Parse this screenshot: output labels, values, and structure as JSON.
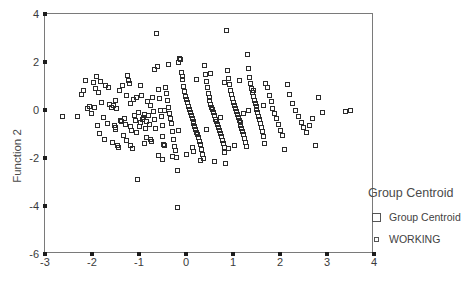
{
  "chart_data": {
    "type": "scatter",
    "title": "",
    "xlabel": "",
    "ylabel": "Function 2",
    "xlim": [
      -3,
      4
    ],
    "ylim": [
      -6,
      4
    ],
    "xticks": [
      -3,
      -2,
      -1,
      0,
      1,
      2,
      3,
      4
    ],
    "yticks": [
      -6,
      -4,
      -2,
      0,
      2,
      4
    ],
    "grid": false,
    "legend_position": "right",
    "legend_title": "Group Centroid",
    "legend": [
      {
        "label": "Group Centroid",
        "marker": "square-open-large"
      },
      {
        "label": "WORKING",
        "marker": "square-open-small"
      }
    ],
    "series": [
      {
        "name": "WORKING",
        "marker": "square-open",
        "color": "#2b2b2b",
        "points": [
          [
            -2.62,
            -0.28
          ],
          [
            -2.3,
            -0.3
          ],
          [
            -2.22,
            0.64
          ],
          [
            -2.12,
            1.22
          ],
          [
            -2.08,
            0.04
          ],
          [
            -2.04,
            0.12
          ],
          [
            -2.0,
            -0.18
          ],
          [
            -1.96,
            1.12
          ],
          [
            -1.92,
            0.86
          ],
          [
            -1.9,
            1.36
          ],
          [
            -1.86,
            0.7
          ],
          [
            -1.84,
            -1.02
          ],
          [
            -1.8,
            1.16
          ],
          [
            -1.78,
            0.3
          ],
          [
            -1.74,
            -0.32
          ],
          [
            -1.7,
            1.02
          ],
          [
            -1.66,
            -0.58
          ],
          [
            -1.62,
            0.22
          ],
          [
            -1.58,
            0.1
          ],
          [
            -1.56,
            -1.38
          ],
          [
            -1.54,
            0.16
          ],
          [
            -1.52,
            -0.66
          ],
          [
            -1.5,
            -0.74
          ],
          [
            -1.48,
            -0.84
          ],
          [
            -1.46,
            0.06
          ],
          [
            -1.44,
            -1.48
          ],
          [
            -1.42,
            -1.6
          ],
          [
            -1.4,
            0.78
          ],
          [
            -1.38,
            -0.44
          ],
          [
            -1.36,
            -0.52
          ],
          [
            -1.34,
            0.98
          ],
          [
            -1.3,
            -0.36
          ],
          [
            -1.28,
            -0.62
          ],
          [
            -1.26,
            -1.3
          ],
          [
            -1.24,
            1.42
          ],
          [
            -1.22,
            1.2
          ],
          [
            -1.2,
            1.08
          ],
          [
            -1.18,
            -0.7
          ],
          [
            -1.16,
            0.26
          ],
          [
            -1.14,
            -0.88
          ],
          [
            -1.12,
            -1.62
          ],
          [
            -1.1,
            0.4
          ],
          [
            -1.08,
            -0.24
          ],
          [
            -1.06,
            -0.46
          ],
          [
            -1.04,
            -0.96
          ],
          [
            -1.02,
            -2.92
          ],
          [
            -1.0,
            -0.14
          ],
          [
            -0.98,
            -0.72
          ],
          [
            -0.96,
            -0.56
          ],
          [
            -0.94,
            0.6
          ],
          [
            -0.92,
            -0.4
          ],
          [
            -0.9,
            -0.34
          ],
          [
            -0.88,
            -0.2
          ],
          [
            -0.86,
            -0.78
          ],
          [
            -0.84,
            -1.18
          ],
          [
            -0.82,
            -0.5
          ],
          [
            -0.8,
            0.34
          ],
          [
            -0.78,
            -0.26
          ],
          [
            -0.76,
            -0.64
          ],
          [
            -0.74,
            -1.24
          ],
          [
            -0.72,
            -1.34
          ],
          [
            -0.7,
            0.52
          ],
          [
            -0.68,
            -0.1
          ],
          [
            -0.66,
            -0.42
          ],
          [
            -0.64,
            -0.8
          ],
          [
            -0.62,
            3.16
          ],
          [
            -0.6,
            1.78
          ],
          [
            -0.58,
            0.84
          ],
          [
            -0.56,
            0.44
          ],
          [
            -0.54,
            -0.06
          ],
          [
            -0.52,
            -0.3
          ],
          [
            -0.5,
            -0.68
          ],
          [
            -0.48,
            -1.12
          ],
          [
            -0.46,
            -1.44
          ],
          [
            -0.44,
            -1.52
          ],
          [
            -0.42,
            0.92
          ],
          [
            -0.4,
            0.66
          ],
          [
            -0.38,
            0.38
          ],
          [
            -0.36,
            0.08
          ],
          [
            -0.34,
            -0.16
          ],
          [
            -0.32,
            -0.38
          ],
          [
            -0.3,
            -0.6
          ],
          [
            -0.28,
            -0.9
          ],
          [
            -0.26,
            -1.26
          ],
          [
            -0.24,
            -1.56
          ],
          [
            -0.22,
            -1.7
          ],
          [
            -0.2,
            -2.02
          ],
          [
            -0.18,
            -4.08
          ],
          [
            -0.16,
            -2.56
          ],
          [
            -0.14,
            1.96
          ],
          [
            -0.12,
            2.12
          ],
          [
            -0.1,
            2.08
          ],
          [
            -0.08,
            1.56
          ],
          [
            -0.06,
            1.24
          ],
          [
            -0.04,
            0.96
          ],
          [
            -0.02,
            0.74
          ],
          [
            0.0,
            0.56
          ],
          [
            0.02,
            0.42
          ],
          [
            0.04,
            0.28
          ],
          [
            0.06,
            0.14
          ],
          [
            0.08,
            0.02
          ],
          [
            0.1,
            -0.12
          ],
          [
            0.12,
            -0.24
          ],
          [
            0.14,
            -0.36
          ],
          [
            0.16,
            -0.48
          ],
          [
            0.18,
            -0.58
          ],
          [
            0.2,
            -0.7
          ],
          [
            0.22,
            -0.82
          ],
          [
            0.24,
            -0.94
          ],
          [
            0.26,
            -1.06
          ],
          [
            0.28,
            -1.18
          ],
          [
            0.3,
            -1.32
          ],
          [
            0.32,
            -1.46
          ],
          [
            0.34,
            -1.66
          ],
          [
            0.36,
            -1.86
          ],
          [
            0.38,
            -2.04
          ],
          [
            0.4,
            1.82
          ],
          [
            0.42,
            1.44
          ],
          [
            0.44,
            1.18
          ],
          [
            0.46,
            0.9
          ],
          [
            0.48,
            0.68
          ],
          [
            0.5,
            0.5
          ],
          [
            0.52,
            0.36
          ],
          [
            0.54,
            0.22
          ],
          [
            0.56,
            0.1
          ],
          [
            0.58,
            -0.02
          ],
          [
            0.6,
            -0.14
          ],
          [
            0.62,
            -0.26
          ],
          [
            0.64,
            -0.4
          ],
          [
            0.66,
            -0.52
          ],
          [
            0.68,
            -0.64
          ],
          [
            0.7,
            -0.76
          ],
          [
            0.72,
            -0.88
          ],
          [
            0.74,
            -1.0
          ],
          [
            0.76,
            -1.14
          ],
          [
            0.78,
            -1.28
          ],
          [
            0.8,
            -1.42
          ],
          [
            0.82,
            -1.58
          ],
          [
            0.84,
            -1.78
          ],
          [
            0.86,
            -2.26
          ],
          [
            0.88,
            3.28
          ],
          [
            0.9,
            1.62
          ],
          [
            0.92,
            1.3
          ],
          [
            0.94,
            1.04
          ],
          [
            0.96,
            0.8
          ],
          [
            0.98,
            0.62
          ],
          [
            1.0,
            0.46
          ],
          [
            1.02,
            0.3
          ],
          [
            1.04,
            0.16
          ],
          [
            1.06,
            0.04
          ],
          [
            1.08,
            -0.08
          ],
          [
            1.1,
            -0.2
          ],
          [
            1.12,
            -0.32
          ],
          [
            1.14,
            -0.44
          ],
          [
            1.16,
            -0.56
          ],
          [
            1.18,
            -0.68
          ],
          [
            1.2,
            -0.8
          ],
          [
            1.22,
            -0.92
          ],
          [
            1.24,
            -1.04
          ],
          [
            1.26,
            -1.2
          ],
          [
            1.28,
            -1.36
          ],
          [
            1.3,
            -1.54
          ],
          [
            1.32,
            2.28
          ],
          [
            1.34,
            1.7
          ],
          [
            1.36,
            1.34
          ],
          [
            1.38,
            1.1
          ],
          [
            1.4,
            0.88
          ],
          [
            1.42,
            0.7
          ],
          [
            1.44,
            0.54
          ],
          [
            1.46,
            0.38
          ],
          [
            1.48,
            0.24
          ],
          [
            1.5,
            0.12
          ],
          [
            1.52,
            0.0
          ],
          [
            1.54,
            -0.12
          ],
          [
            1.56,
            -0.28
          ],
          [
            1.58,
            -0.42
          ],
          [
            1.6,
            -0.58
          ],
          [
            1.62,
            -0.74
          ],
          [
            1.64,
            -0.9
          ],
          [
            1.66,
            -1.12
          ],
          [
            1.68,
            -1.4
          ],
          [
            1.7,
            1.08
          ],
          [
            1.74,
            0.92
          ],
          [
            1.78,
            0.58
          ],
          [
            1.82,
            0.32
          ],
          [
            1.86,
            0.06
          ],
          [
            1.9,
            -0.18
          ],
          [
            1.94,
            -0.38
          ],
          [
            1.98,
            -0.62
          ],
          [
            2.02,
            -0.86
          ],
          [
            2.06,
            -1.08
          ],
          [
            2.1,
            -1.66
          ],
          [
            2.16,
            1.04
          ],
          [
            2.22,
            0.62
          ],
          [
            2.28,
            0.24
          ],
          [
            2.34,
            -0.04
          ],
          [
            2.4,
            -0.3
          ],
          [
            2.46,
            -0.56
          ],
          [
            2.52,
            -0.76
          ],
          [
            2.58,
            -0.94
          ],
          [
            2.64,
            -0.66
          ],
          [
            2.7,
            -0.36
          ],
          [
            2.76,
            -1.48
          ],
          [
            2.84,
            0.52
          ],
          [
            2.92,
            -0.14
          ],
          [
            3.4,
            -0.1
          ],
          [
            3.5,
            -0.06
          ],
          [
            -1.94,
            0.08
          ],
          [
            -1.64,
            0.92
          ],
          [
            -1.32,
            -1.08
          ],
          [
            -1.05,
            0.52
          ],
          [
            -0.75,
            0.18
          ],
          [
            -0.45,
            -0.04
          ],
          [
            -0.15,
            -0.88
          ],
          [
            0.15,
            -1.6
          ],
          [
            0.45,
            -0.84
          ],
          [
            0.75,
            -0.34
          ],
          [
            1.05,
            -1.48
          ],
          [
            1.35,
            -0.06
          ],
          [
            1.65,
            0.16
          ],
          [
            -1.88,
            -0.66
          ],
          [
            -1.48,
            0.36
          ],
          [
            -1.18,
            -1.52
          ],
          [
            -0.88,
            -1.4
          ],
          [
            -0.58,
            -1.92
          ],
          [
            -0.28,
            -1.96
          ],
          [
            0.02,
            -1.88
          ],
          [
            0.32,
            -2.12
          ],
          [
            0.62,
            -2.18
          ],
          [
            0.92,
            -1.64
          ],
          [
            -2.16,
            0.8
          ],
          [
            -1.72,
            -1.26
          ],
          [
            -1.26,
            0.6
          ],
          [
            -0.96,
            1.0
          ],
          [
            -0.66,
            1.66
          ],
          [
            -0.36,
            1.86
          ],
          [
            -0.06,
            1.36
          ],
          [
            0.24,
            1.26
          ],
          [
            0.54,
            1.5
          ],
          [
            0.84,
            1.14
          ],
          [
            1.14,
            1.22
          ],
          [
            1.44,
            0.78
          ],
          [
            -0.5,
            -2.08
          ],
          [
            0.18,
            -1.76
          ],
          [
            1.24,
            -0.18
          ]
        ]
      }
    ]
  },
  "axis": {
    "ylabel": "Function 2",
    "yticks": [
      "4",
      "2",
      "0",
      "-2",
      "-4",
      "-6"
    ],
    "xticks": [
      "-3",
      "-2",
      "-1",
      "0",
      "1",
      "2",
      "3",
      "4"
    ]
  },
  "legend": {
    "title": "Group Centroid",
    "entries": [
      {
        "label": "Group Centroid"
      },
      {
        "label": "WORKING"
      }
    ]
  }
}
